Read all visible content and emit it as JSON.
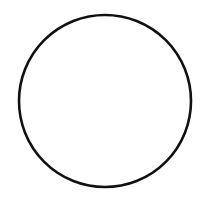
{
  "canvas": {
    "width": 205,
    "height": 202,
    "background_color": "#ffffff",
    "figure_name": "circle-outline"
  },
  "shapes": [
    {
      "name": "circle-outline",
      "type": "circle",
      "center_x": 105,
      "center_y": 101,
      "radius": 86,
      "stroke_color": "#111111",
      "stroke_width": 2.6,
      "fill_color": "none"
    }
  ],
  "labels": {
    "alt_text": "Black outlined circle on white background"
  }
}
